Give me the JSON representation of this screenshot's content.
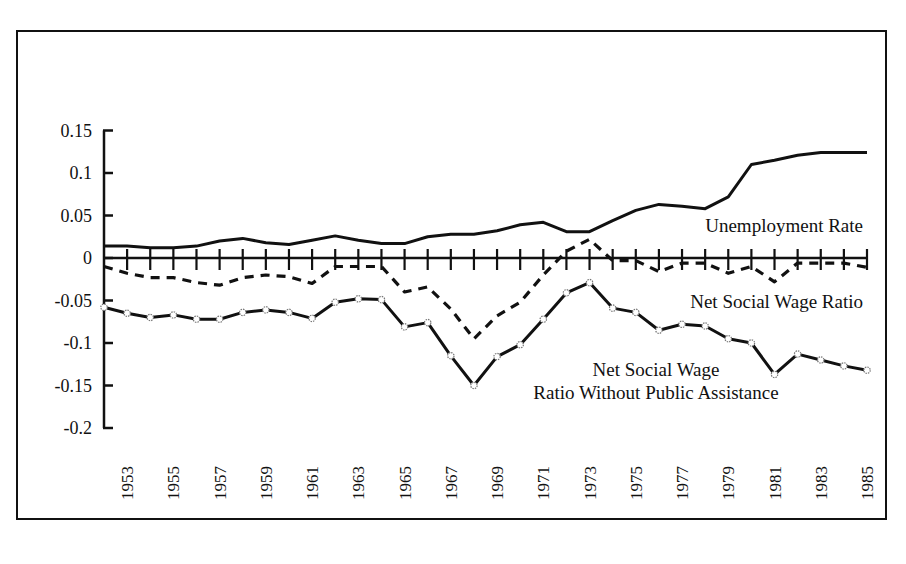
{
  "chart_data": {
    "type": "line",
    "title": "",
    "xlabel": "",
    "ylabel": "",
    "x": [
      1952,
      1953,
      1954,
      1955,
      1956,
      1957,
      1958,
      1959,
      1960,
      1961,
      1962,
      1963,
      1964,
      1965,
      1966,
      1967,
      1968,
      1969,
      1970,
      1971,
      1972,
      1973,
      1974,
      1975,
      1976,
      1977,
      1978,
      1979,
      1980,
      1981,
      1982,
      1983,
      1984,
      1985
    ],
    "x_tick_labels": [
      "1953",
      "1955",
      "1957",
      "1959",
      "1961",
      "1963",
      "1965",
      "1967",
      "1969",
      "1971",
      "1973",
      "1975",
      "1977",
      "1979",
      "1981",
      "1983",
      "1985"
    ],
    "y_tick_labels": [
      "0.15",
      "0.1",
      "0.05",
      "0",
      "-0.05",
      "-0.1",
      "-0.15",
      "-0.2"
    ],
    "ylim": [
      -0.2,
      0.15
    ],
    "grid": false,
    "legend": "inline labels",
    "series": [
      {
        "name": "Unemployment Rate",
        "style": "solid",
        "values": [
          0.014,
          0.014,
          0.012,
          0.012,
          0.014,
          0.02,
          0.023,
          0.018,
          0.016,
          0.021,
          0.026,
          0.021,
          0.017,
          0.017,
          0.025,
          0.028,
          0.028,
          0.032,
          0.039,
          0.042,
          0.031,
          0.031,
          0.044,
          0.056,
          0.063,
          0.061,
          0.058,
          0.072,
          0.11,
          0.115,
          0.121,
          0.124,
          0.124,
          0.124
        ]
      },
      {
        "name": "Net Social Wage Ratio",
        "style": "dashed",
        "values": [
          -0.01,
          -0.018,
          -0.023,
          -0.023,
          -0.029,
          -0.032,
          -0.023,
          -0.02,
          -0.022,
          -0.03,
          -0.01,
          -0.01,
          -0.01,
          -0.04,
          -0.034,
          -0.06,
          -0.095,
          -0.068,
          -0.052,
          -0.02,
          0.008,
          0.022,
          -0.003,
          -0.003,
          -0.016,
          -0.006,
          -0.006,
          -0.018,
          -0.01,
          -0.028,
          -0.006,
          -0.006,
          -0.006,
          -0.011
        ]
      },
      {
        "name": "Net Social Wage Ratio Without Public Assistance",
        "style": "solid-with-markers",
        "values": [
          -0.058,
          -0.065,
          -0.07,
          -0.067,
          -0.072,
          -0.072,
          -0.064,
          -0.061,
          -0.064,
          -0.071,
          -0.052,
          -0.048,
          -0.049,
          -0.081,
          -0.076,
          -0.115,
          -0.15,
          -0.116,
          -0.102,
          -0.072,
          -0.041,
          -0.029,
          -0.059,
          -0.064,
          -0.085,
          -0.078,
          -0.08,
          -0.095,
          -0.1,
          -0.137,
          -0.113,
          -0.12,
          -0.127,
          -0.132
        ]
      }
    ],
    "annotations": [
      {
        "text": "Unemployment Rate",
        "near": "1985, 0.04"
      },
      {
        "text": "Net Social Wage Ratio",
        "near": "1985, -0.05"
      },
      {
        "text": "Net Social Wage",
        "near": "1978, -0.11"
      },
      {
        "text": "Ratio Without Public Assistance",
        "near": "1978, -0.13"
      }
    ]
  },
  "labels": {
    "unemployment": "Unemployment Rate",
    "nsw": "Net Social Wage Ratio",
    "nswpa_line1": "Net Social Wage",
    "nswpa_line2": "Ratio Without Public Assistance"
  }
}
